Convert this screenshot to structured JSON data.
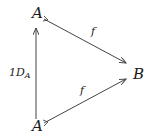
{
  "diagram": {
    "type": "commutative-triangle",
    "nodes": [
      {
        "id": "A_top",
        "label": "A"
      },
      {
        "id": "B",
        "label": "B"
      },
      {
        "id": "A_bottom",
        "label": "A"
      }
    ],
    "edges": [
      {
        "from": "A_top",
        "to": "B",
        "label": "f"
      },
      {
        "from": "A_bottom",
        "to": "B",
        "label": "f"
      },
      {
        "from": "A_bottom",
        "to": "A_top",
        "label_main": "1D",
        "label_sub": "A"
      }
    ],
    "colors": {
      "stroke": "#444444",
      "text": "#1a1a1a",
      "background": "#ffffff"
    }
  }
}
